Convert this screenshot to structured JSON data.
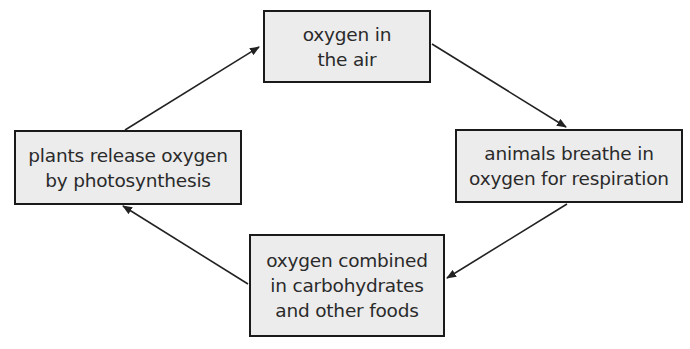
{
  "diagram": {
    "colors": {
      "box_fill": "#ececec",
      "box_border": "#1a1a1a",
      "text": "#2a2a2a",
      "arrow": "#222222"
    },
    "nodes": [
      {
        "id": "air",
        "lines": [
          "oxygen in",
          "the air"
        ]
      },
      {
        "id": "animals",
        "lines": [
          "animals breathe in",
          "oxygen for respiration"
        ]
      },
      {
        "id": "foods",
        "lines": [
          "oxygen combined",
          "in carbohydrates",
          "and other foods"
        ]
      },
      {
        "id": "plants",
        "lines": [
          "plants release oxygen",
          "by photosynthesis"
        ]
      }
    ],
    "edges": [
      {
        "from": "air",
        "to": "animals"
      },
      {
        "from": "animals",
        "to": "foods"
      },
      {
        "from": "foods",
        "to": "plants"
      },
      {
        "from": "plants",
        "to": "air"
      }
    ]
  }
}
